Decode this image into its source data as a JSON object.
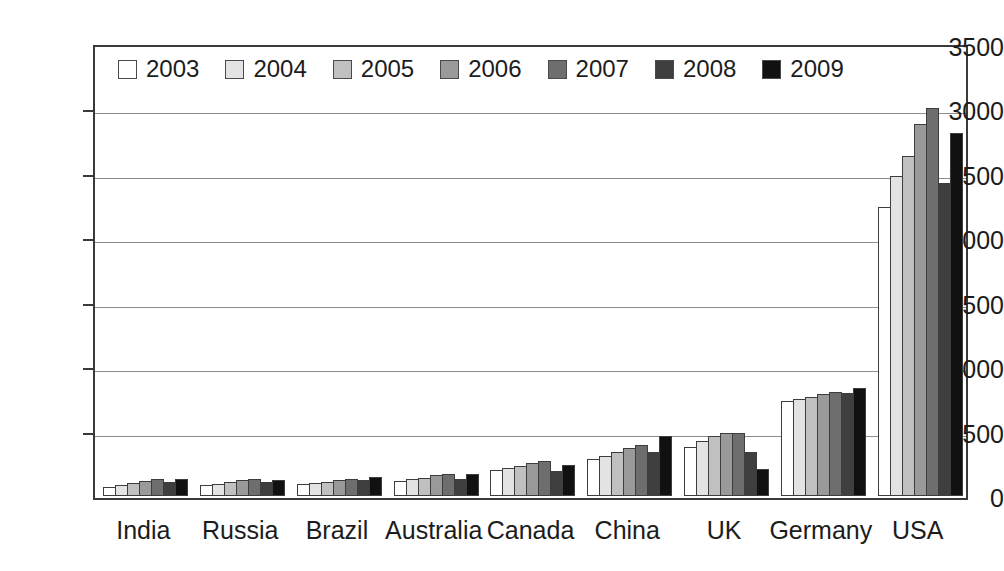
{
  "chart_data": {
    "type": "bar",
    "title": "",
    "xlabel": "",
    "ylabel": "",
    "ylim": [
      0,
      3500
    ],
    "yticks": [
      0,
      500,
      1000,
      1500,
      2000,
      2500,
      3000,
      3500
    ],
    "ytick_labels": [
      "0",
      "500",
      "1000",
      "1500",
      "2000",
      "2500",
      "3000",
      "3500"
    ],
    "grid": true,
    "legend_position": "top-left-inside",
    "categories": [
      "India",
      "Russia",
      "Brazil",
      "Australia",
      "Canada",
      "China",
      "UK",
      "Germany",
      "USA"
    ],
    "series": [
      {
        "name": "2003",
        "color": "#ffffff",
        "values": [
          70,
          85,
          90,
          120,
          200,
          285,
          380,
          740,
          2240
        ]
      },
      {
        "name": "2004",
        "color": "#e3e3e3",
        "values": [
          85,
          95,
          100,
          130,
          215,
          310,
          425,
          750,
          2480
        ]
      },
      {
        "name": "2005",
        "color": "#c0c0c0",
        "values": [
          100,
          110,
          110,
          140,
          230,
          340,
          465,
          770,
          2640
        ]
      },
      {
        "name": "2006",
        "color": "#9a9a9a",
        "values": [
          115,
          125,
          125,
          165,
          255,
          370,
          490,
          790,
          2890
        ]
      },
      {
        "name": "2007",
        "color": "#6e6e6e",
        "values": [
          130,
          135,
          135,
          170,
          270,
          395,
          490,
          810,
          3010
        ]
      },
      {
        "name": "2008",
        "color": "#3f3f3f",
        "values": [
          105,
          110,
          125,
          130,
          195,
          345,
          340,
          800,
          2430
        ]
      },
      {
        "name": "2009",
        "color": "#111111",
        "values": [
          130,
          125,
          145,
          170,
          240,
          465,
          210,
          840,
          2820
        ]
      }
    ]
  },
  "legend": {
    "entries": [
      {
        "label": "2003"
      },
      {
        "label": "2004"
      },
      {
        "label": "2005"
      },
      {
        "label": "2006"
      },
      {
        "label": "2007"
      },
      {
        "label": "2008"
      },
      {
        "label": "2009"
      }
    ]
  }
}
